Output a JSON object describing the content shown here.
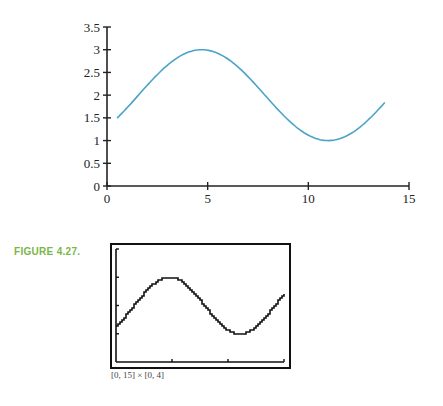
{
  "chart_data": [
    {
      "type": "line",
      "title": "",
      "xlabel": "",
      "ylabel": "",
      "xlim": [
        0,
        15
      ],
      "ylim": [
        0,
        3.5
      ],
      "x_ticks": [
        "0",
        "5",
        "10",
        "15"
      ],
      "y_ticks": [
        "0",
        "0.5",
        "1",
        "1.5",
        "2",
        "2.5",
        "3",
        "3.5"
      ],
      "grid": false,
      "series": [
        {
          "name": "curve",
          "color": "#4aa3c8",
          "x": [
            0.5,
            1.5,
            2.5,
            3.5,
            4.5,
            5.5,
            6.5,
            7.5,
            8.5,
            9.5,
            10.5,
            11.5,
            12.5,
            13.8
          ],
          "y": [
            1.5,
            1.97,
            2.43,
            2.8,
            2.99,
            2.97,
            2.73,
            2.34,
            1.87,
            1.42,
            1.09,
            1.0,
            1.18,
            1.6
          ]
        }
      ],
      "description": "Sinusoidal curve approximately y = 2 + sin(x/2 - 0.7), max 3 near x≈4.5, min 1 near x≈10.5"
    },
    {
      "type": "line",
      "title": "Graphing calculator screen",
      "window": "[0, 15] × [0, 4]",
      "xlim": [
        0,
        15
      ],
      "ylim": [
        0,
        4
      ],
      "series": [
        {
          "name": "calculator-curve",
          "color": "#111111",
          "x": [
            0,
            2,
            4,
            4.5,
            6,
            8,
            10,
            10.5,
            12,
            14,
            15
          ],
          "y": [
            1.55,
            2.4,
            3.0,
            3.0,
            2.7,
            1.85,
            1.05,
            1.0,
            1.45,
            2.3,
            2.7
          ]
        }
      ]
    }
  ],
  "figure": {
    "label": "FIGURE 4.27.",
    "caption": "[0, 15] × [0, 4]",
    "accent_color": "#7ab648"
  },
  "axis": {
    "x_ticks": [
      "0",
      "5",
      "10",
      "15"
    ],
    "y_ticks": [
      "0",
      "0.5",
      "1",
      "1.5",
      "2",
      "2.5",
      "3",
      "3.5"
    ]
  }
}
